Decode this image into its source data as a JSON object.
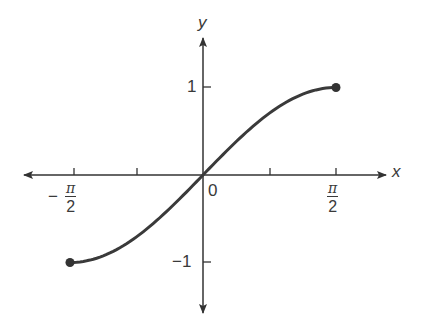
{
  "chart_data": {
    "type": "line",
    "title": "",
    "function": "y = sin(x)",
    "xlabel": "x",
    "ylabel": "y",
    "xlim": [
      -1.5708,
      1.5708
    ],
    "ylim": [
      -1,
      1
    ],
    "grid": false,
    "legend": null,
    "x_ticks": [
      {
        "value": -1.5708,
        "label": "-π/2"
      },
      {
        "value": -0.7854,
        "label": ""
      },
      {
        "value": 0,
        "label": "0"
      },
      {
        "value": 0.7854,
        "label": ""
      },
      {
        "value": 1.5708,
        "label": "π/2"
      }
    ],
    "y_ticks": [
      {
        "value": 1,
        "label": "1"
      },
      {
        "value": -1,
        "label": "-1"
      }
    ],
    "series": [
      {
        "name": "sin x",
        "x": [
          -1.5708,
          -1.1781,
          -0.7854,
          -0.3927,
          0,
          0.3927,
          0.7854,
          1.1781,
          1.5708
        ],
        "y": [
          -1,
          -0.9239,
          -0.7071,
          -0.3827,
          0,
          0.3827,
          0.7071,
          0.9239,
          1
        ],
        "endpoints": "closed",
        "color": "#333333"
      }
    ]
  },
  "labels": {
    "x_axis": "x",
    "y_axis": "y",
    "origin": "0",
    "y_pos_one": "1",
    "y_neg_one": "−1",
    "x_neg_minus": "−",
    "pi": "π",
    "two": "2"
  },
  "colors": {
    "axis": "#333333",
    "curve": "#3a3a3a",
    "background": "#ffffff"
  }
}
